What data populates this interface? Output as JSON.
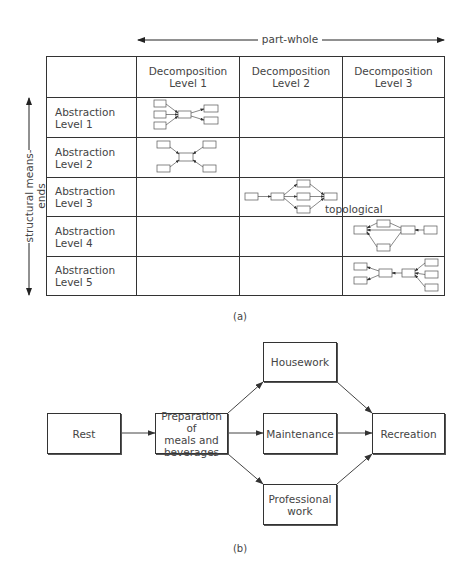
{
  "figure_a": {
    "top_axis": {
      "label": "part-whole",
      "direction": "bidirectional"
    },
    "side_axis": {
      "label": "structural means-ends",
      "direction": "bidirectional"
    },
    "columns": [
      {
        "line1": "Decomposition",
        "line2": "Level 1"
      },
      {
        "line1": "Decomposition",
        "line2": "Level 2"
      },
      {
        "line1": "Decomposition",
        "line2": "Level 3"
      }
    ],
    "rows": [
      {
        "line1": "Abstraction",
        "line2": "Level 1",
        "diagram_column": 1
      },
      {
        "line1": "Abstraction",
        "line2": "Level 2",
        "diagram_column": 1
      },
      {
        "line1": "Abstraction",
        "line2": "Level 3",
        "diagram_column": 2
      },
      {
        "line1": "Abstraction",
        "line2": "Level 4",
        "diagram_column": 3
      },
      {
        "line1": "Abstraction",
        "line2": "Level 5",
        "diagram_column": 3
      }
    ],
    "annotation": "topological",
    "caption": "(a)"
  },
  "figure_b": {
    "nodes": {
      "rest": "Rest",
      "prep": {
        "line1": "Preparation of",
        "line2": "meals and",
        "line3": "beverages"
      },
      "housework": "Housework",
      "maintenance": "Maintenance",
      "professional": {
        "line1": "Professional",
        "line2": "work"
      },
      "recreation": "Recreation"
    },
    "edges": [
      [
        "Rest",
        "Preparation of meals and beverages"
      ],
      [
        "Preparation of meals and beverages",
        "Housework"
      ],
      [
        "Preparation of meals and beverages",
        "Maintenance"
      ],
      [
        "Preparation of meals and beverages",
        "Professional work"
      ],
      [
        "Housework",
        "Recreation"
      ],
      [
        "Maintenance",
        "Recreation"
      ],
      [
        "Professional work",
        "Recreation"
      ]
    ],
    "caption": "(b)"
  }
}
